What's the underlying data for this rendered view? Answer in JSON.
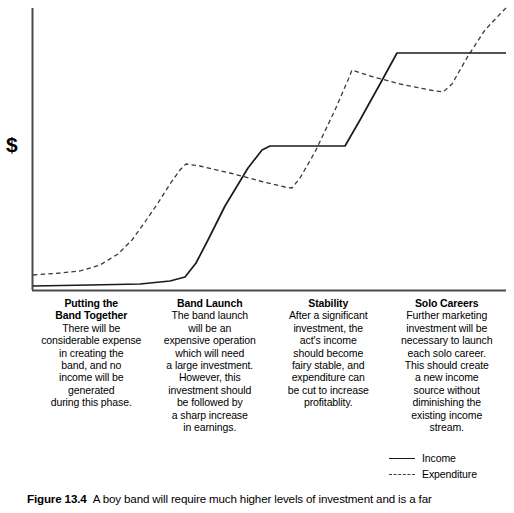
{
  "figure": {
    "y_axis_label": "$",
    "caption_label": "Figure 13.4",
    "caption_text": "A boy band will require much higher levels of investment and is a far"
  },
  "legend": {
    "items": [
      {
        "label": "Income",
        "style": "solid"
      },
      {
        "label": "Expenditure",
        "style": "dashed"
      }
    ]
  },
  "phases": [
    {
      "title": "Putting the\nBand Together",
      "body": "There will be\nconsiderable expense\nin creating the\nband, and no\nincome will be\ngenerated\nduring this phase."
    },
    {
      "title": "Band Launch",
      "body": "The band launch\nwill be an\nexpensive operation\nwhich will need\na large investment.\nHowever, this\ninvestment should\nbe followed by\na sharp increase\nin earnings."
    },
    {
      "title": "Stability",
      "body": "After a significant\ninvestment, the\nact's income\nshould become\nfairy stable, and\nexpenditure can\nbe cut to increase\nprofitablity."
    },
    {
      "title": "Solo Careers",
      "body": "Further marketing\ninvestment will be\nnecessary to launch\neach solo career.\nThis should create\na new income\nsource without\ndiminishing the\nexisting income\nstream."
    }
  ],
  "chart_data": {
    "type": "line",
    "title": "",
    "xlabel": "",
    "ylabel": "$",
    "grid": false,
    "legend_position": "bottom-right",
    "axis": {
      "x_pixel_range": [
        32,
        506
      ],
      "y_pixel_range": [
        290,
        8
      ],
      "x_domain": [
        0,
        100
      ],
      "y_domain": [
        0,
        100
      ],
      "phase_boundaries": [
        0,
        25,
        50,
        75,
        100
      ]
    },
    "series": [
      {
        "name": "Income",
        "style": "solid",
        "color": "#1a1a1a",
        "points_px": [
          [
            33,
            286
          ],
          [
            90,
            285
          ],
          [
            140,
            284
          ],
          [
            170,
            281
          ],
          [
            185,
            277
          ],
          [
            196,
            263
          ],
          [
            208,
            240
          ],
          [
            225,
            206
          ],
          [
            248,
            168
          ],
          [
            262,
            150
          ],
          [
            270,
            146
          ],
          [
            290,
            146
          ],
          [
            345,
            146
          ],
          [
            360,
            120
          ],
          [
            380,
            84
          ],
          [
            397,
            53
          ],
          [
            430,
            53
          ],
          [
            470,
            53
          ],
          [
            506,
            53
          ]
        ],
        "description": "Income stays near zero during band formation, rises sharply at launch, plateaus during stability, steps up again for solo careers then plateaus."
      },
      {
        "name": "Expenditure",
        "style": "dashed",
        "color": "#3a3a3a",
        "points_px": [
          [
            33,
            275
          ],
          [
            60,
            273
          ],
          [
            80,
            271
          ],
          [
            100,
            265
          ],
          [
            118,
            254
          ],
          [
            132,
            240
          ],
          [
            145,
            222
          ],
          [
            158,
            203
          ],
          [
            170,
            184
          ],
          [
            180,
            170
          ],
          [
            186,
            164
          ],
          [
            200,
            166
          ],
          [
            230,
            173
          ],
          [
            260,
            181
          ],
          [
            285,
            187
          ],
          [
            292,
            188
          ],
          [
            300,
            178
          ],
          [
            315,
            152
          ],
          [
            335,
            110
          ],
          [
            348,
            80
          ],
          [
            352,
            70
          ],
          [
            370,
            76
          ],
          [
            400,
            84
          ],
          [
            430,
            90
          ],
          [
            443,
            92
          ],
          [
            452,
            84
          ],
          [
            468,
            56
          ],
          [
            485,
            30
          ],
          [
            500,
            14
          ],
          [
            506,
            8
          ]
        ],
        "description": "Expenditure starts above income, rises steeply through band formation to a launch peak, tapers during stability, then spikes again for solo careers."
      }
    ]
  }
}
